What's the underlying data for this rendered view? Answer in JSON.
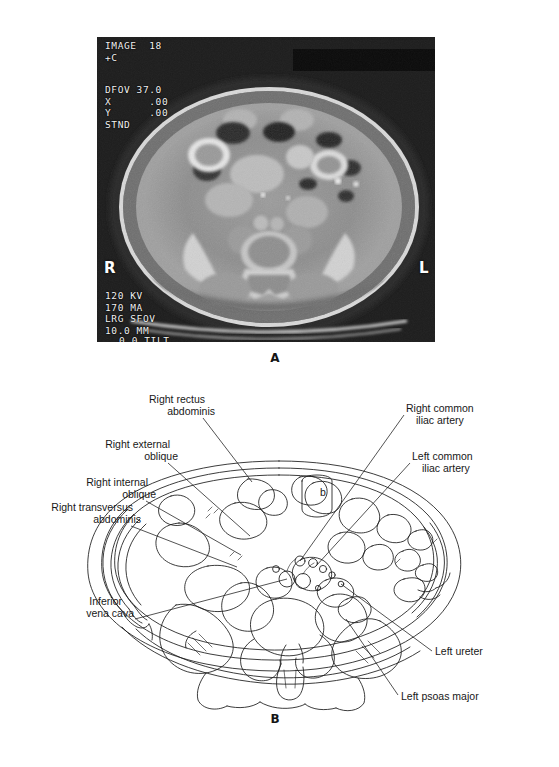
{
  "figure": {
    "type": "medical-imaging-figure"
  },
  "panel_a": {
    "letter": "A",
    "modality": "CT",
    "osd": {
      "image_line": "IMAGE  18",
      "contrast": "+C",
      "dfov": "DFOV 37.0",
      "x_offset": "X      .00",
      "y_offset": "Y      .00",
      "algorithm": "STND",
      "kv": "120 KV",
      "ma": "170 MA",
      "sfov": "LRG SFOV",
      "slice": "10.0 MM",
      "tilt": "0.0 TILT"
    },
    "markers": {
      "right": "R",
      "left": "L"
    }
  },
  "panel_b": {
    "letter": "B",
    "labels_left": [
      {
        "id": "right-rectus-abdominis",
        "lines": [
          "Right rectus",
          "abdominis"
        ]
      },
      {
        "id": "right-external-oblique",
        "lines": [
          "Right external",
          "oblique"
        ]
      },
      {
        "id": "right-internal-oblique",
        "lines": [
          "Right internal",
          "oblique"
        ]
      },
      {
        "id": "right-transversus-abdominis",
        "lines": [
          "Right transversus",
          "abdominis"
        ]
      },
      {
        "id": "inferior-vena-cava",
        "lines": [
          "Inferior",
          "vena cava"
        ]
      }
    ],
    "labels_right": [
      {
        "id": "right-common-iliac-artery",
        "lines": [
          "Right common",
          "iliac artery"
        ]
      },
      {
        "id": "left-common-iliac-artery",
        "lines": [
          "Left common",
          "iliac artery"
        ]
      },
      {
        "id": "left-ureter",
        "lines": [
          "Left ureter"
        ]
      },
      {
        "id": "left-psoas-major",
        "lines": [
          "Left psoas major"
        ]
      }
    ],
    "inline_marks": [
      {
        "id": "bladder-mark",
        "text": "b"
      }
    ]
  },
  "colors": {
    "ink": "#1a1a1a",
    "paper": "#ffffff",
    "ct_background": "#8a8a8a",
    "osd_text": "#f2f2f2"
  }
}
